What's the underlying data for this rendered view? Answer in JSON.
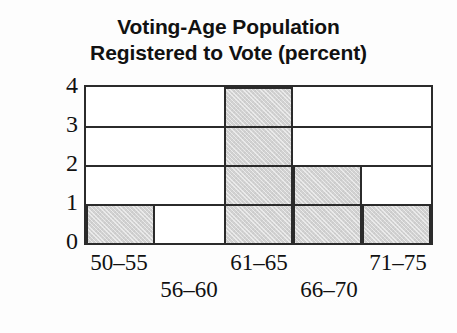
{
  "chart_data": {
    "type": "bar",
    "title": "Voting-Age Population Registered to Vote (percent)",
    "title_lines": [
      "Voting-Age Population",
      "Registered to Vote (percent)"
    ],
    "xlabel": "",
    "ylabel": "Frequency",
    "categories": [
      "50–55",
      "56–60",
      "61–65",
      "66–70",
      "71–75"
    ],
    "values": [
      1,
      0,
      4,
      2,
      1
    ],
    "ylim": [
      0,
      4
    ],
    "ytick_labels": [
      "0",
      "1",
      "2",
      "3",
      "4"
    ],
    "ytick_values": [
      0,
      1,
      2,
      3,
      4
    ],
    "gridlines": [
      1,
      2,
      3
    ],
    "grid": true,
    "legend": null,
    "bar_fill_color": "#d2d2d2",
    "bar_border_color": "#2b2b2b",
    "axis_color": "#2b2b2b",
    "background_color": "#fdfdfd",
    "histogram_style": true,
    "xlabel_rows": [
      {
        "index": 0,
        "label": "50–55",
        "row": "top"
      },
      {
        "index": 1,
        "label": "56–60",
        "row": "bottom"
      },
      {
        "index": 2,
        "label": "61–65",
        "row": "top"
      },
      {
        "index": 3,
        "label": "66–70",
        "row": "bottom"
      },
      {
        "index": 4,
        "label": "71–75",
        "row": "top"
      }
    ]
  }
}
